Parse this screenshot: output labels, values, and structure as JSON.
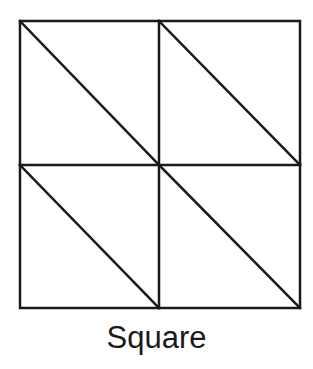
{
  "diagram": {
    "caption": "Square",
    "stroke_color": "#1a1a1a",
    "background": "#ffffff",
    "grid": {
      "rows": 2,
      "cols": 2
    }
  }
}
